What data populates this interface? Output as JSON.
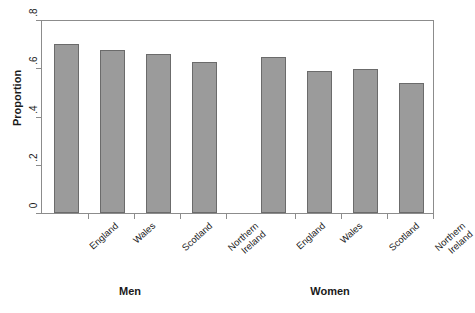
{
  "chart_data": {
    "type": "bar",
    "title": "",
    "xlabel": "",
    "ylabel": "Proportion",
    "ylim": [
      0,
      0.8
    ],
    "yticks": [
      "0",
      ".2",
      ".4",
      ".6",
      ".8"
    ],
    "ytick_values": [
      0,
      0.2,
      0.4,
      0.6,
      0.8
    ],
    "grid": false,
    "legend": "none",
    "groups": [
      "Men",
      "Women"
    ],
    "categories": [
      "England",
      "Wales",
      "Scotland",
      "Northern Ireland"
    ],
    "series": [
      {
        "name": "Men",
        "values": [
          0.7,
          0.675,
          0.66,
          0.625
        ]
      },
      {
        "name": "Women",
        "values": [
          0.645,
          0.59,
          0.595,
          0.54
        ]
      }
    ],
    "bars": [
      {
        "group": "Men",
        "category": "England",
        "label_line1": "England",
        "label_line2": "",
        "value": 0.7
      },
      {
        "group": "Men",
        "category": "Wales",
        "label_line1": "Wales",
        "label_line2": "",
        "value": 0.675
      },
      {
        "group": "Men",
        "category": "Scotland",
        "label_line1": "Scotland",
        "label_line2": "",
        "value": 0.66
      },
      {
        "group": "Men",
        "category": "Northern Ireland",
        "label_line1": "Northern",
        "label_line2": "Ireland",
        "value": 0.625
      },
      {
        "group": "Women",
        "category": "England",
        "label_line1": "England",
        "label_line2": "",
        "value": 0.645
      },
      {
        "group": "Women",
        "category": "Wales",
        "label_line1": "Wales",
        "label_line2": "",
        "value": 0.59
      },
      {
        "group": "Women",
        "category": "Scotland",
        "label_line1": "Scotland",
        "label_line2": "",
        "value": 0.595
      },
      {
        "group": "Women",
        "category": "Northern Ireland",
        "label_line1": "Northern",
        "label_line2": "Ireland",
        "value": 0.54
      }
    ],
    "colors": {
      "bar_fill": "#9b9b9b",
      "bar_border": "#6b6b6b",
      "axis": "#8c8c8c",
      "text": "#1a1a1a",
      "background": "#ffffff"
    }
  },
  "axis": {
    "y_title": "Proportion",
    "y_tick_labels": [
      "0",
      ".2",
      ".4",
      ".6",
      ".8"
    ]
  },
  "group_labels": [
    {
      "text": "Men"
    },
    {
      "text": "Women"
    }
  ]
}
